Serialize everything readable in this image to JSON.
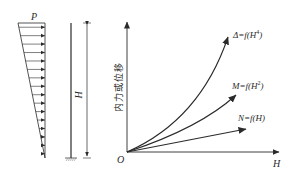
{
  "load_diagram": {
    "load_label": "P",
    "arrow_count": 16,
    "shape": "triangular distributed load, max at top, zero at base"
  },
  "column": {
    "height_label": "H",
    "support": "fixed base"
  },
  "graph": {
    "y_axis_label": "内力或位移",
    "x_axis_label": "H",
    "origin_label": "O",
    "curves": [
      {
        "name": "displacement",
        "label_prefix": "Δ=f(H",
        "exponent": "4",
        "label_suffix": ")"
      },
      {
        "name": "moment",
        "label_prefix": "M=f(H",
        "exponent": "2",
        "label_suffix": ")"
      },
      {
        "name": "axial",
        "label_prefix": "N=f(H)",
        "exponent": "",
        "label_suffix": ""
      }
    ]
  },
  "colors": {
    "stroke": "#2a2a2a",
    "background": "#ffffff"
  }
}
